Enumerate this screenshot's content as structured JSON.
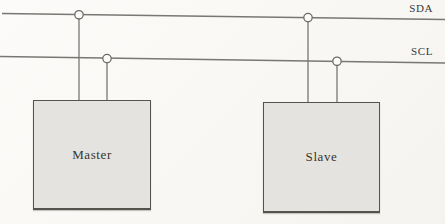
{
  "bus": {
    "sda_label": "SDA",
    "scl_label": "SCL"
  },
  "devices": {
    "master_label": "Master",
    "slave_label": "Slave"
  },
  "icons": {
    "junction_dot": "open-circle-node"
  },
  "colors": {
    "wire": "#787774",
    "box_fill": "#e4e3df",
    "box_border": "#55534d",
    "background": "#fbfaf8",
    "text": "#36342f"
  }
}
